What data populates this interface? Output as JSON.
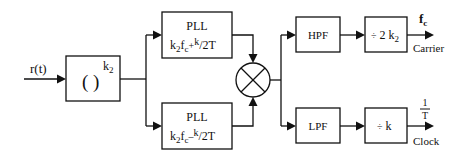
{
  "diagram": {
    "type": "block-diagram",
    "input": {
      "label": "r(t)"
    },
    "power_block": {
      "label": "( )",
      "exponent": "k",
      "exponent_sub": "2"
    },
    "pll_top": {
      "title": "PLL",
      "expr": {
        "a": "k",
        "a_sub": "2",
        "b": "f",
        "b_sub": "c",
        "op": "+",
        "num": "k",
        "den": "/2T"
      }
    },
    "pll_bottom": {
      "title": "PLL",
      "expr": {
        "a": "k",
        "a_sub": "2",
        "b": "f",
        "b_sub": "c",
        "op": "–",
        "num": "k",
        "den": "/2T"
      }
    },
    "multiplier": {
      "symbol": "multiply-x"
    },
    "hpf": {
      "label": "HPF"
    },
    "lpf": {
      "label": "LPF"
    },
    "div_top": {
      "sym": "÷",
      "text": " 2 k",
      "sub": "2"
    },
    "div_bottom": {
      "sym": "÷",
      "text": " k"
    },
    "out_top": {
      "symbol": "f",
      "symbol_sub": "c",
      "label": "Carrier"
    },
    "out_bottom": {
      "num": "1",
      "den": "T",
      "label": "Clock"
    }
  }
}
